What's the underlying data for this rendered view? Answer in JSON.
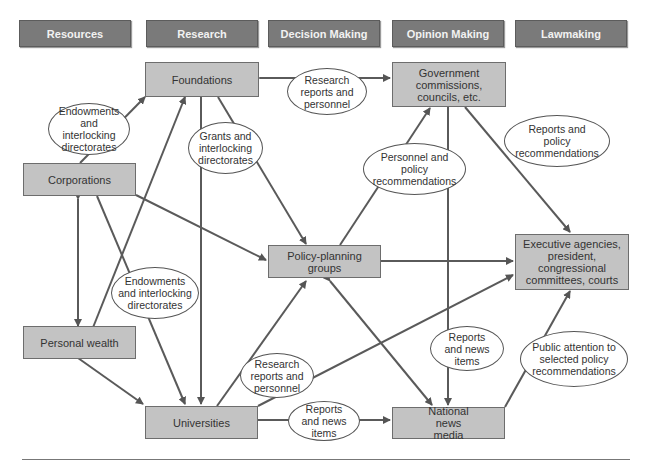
{
  "headers": [
    "Resources",
    "Research",
    "Decision Making",
    "Opinion Making",
    "Lawmaking"
  ],
  "nodes": {
    "foundations": "Foundations",
    "government": "Government commissions, councils, etc.",
    "corporations": "Corporations",
    "policy_planning": "Policy-planning groups",
    "executive": "Executive agencies, president, congressional committees, courts",
    "personal_wealth": "Personal wealth",
    "universities": "Universities",
    "news_media": "National news media"
  },
  "labels": {
    "corp_found": "Endowments and interlocking directorates",
    "found_gov": "Research reports and personnel",
    "found_policy": "Grants and interlocking directorates",
    "policy_gov": "Personnel and policy recommendations",
    "gov_exec": "Reports and policy recommendations",
    "corp_univ": "Endowments and interlocking directorates",
    "univ_policy": "Research reports and personnel",
    "gov_media": "Reports and news items",
    "media_exec": "Public attention to selected policy recommendations",
    "univ_media": "Reports and news items"
  },
  "colors": {
    "header_fill": "#7a7a7a",
    "box_fill": "#c3c3c3",
    "line": "#555555"
  }
}
